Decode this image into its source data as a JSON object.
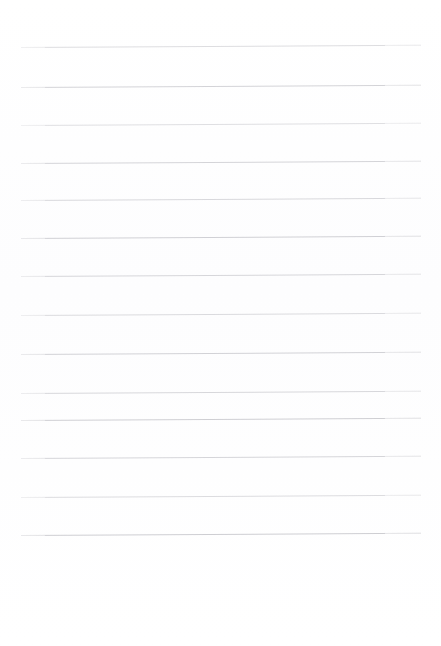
{
  "document": {
    "kind": "scanned-lined-paper",
    "title": "Blank ruled notebook page",
    "written_text": "",
    "page_background_color": "#ffffff",
    "rule_color": "#c9c9ce",
    "page_width": 441,
    "page_height": 646
  },
  "layout": {
    "rule_left_x": 21,
    "rule_right_x": 420,
    "rule_length": 400,
    "rule_thickness": 1,
    "line_spacing": 39,
    "first_line_y": 47,
    "last_line_y": 535,
    "top_margin": 47,
    "bottom_margin": 111,
    "skew_degrees": -0.33,
    "line_count": 14
  },
  "rules": [
    {
      "index": 1,
      "y": 47,
      "label": "ruled-line-1"
    },
    {
      "index": 2,
      "y": 87,
      "label": "ruled-line-2"
    },
    {
      "index": 3,
      "y": 125,
      "label": "ruled-line-3"
    },
    {
      "index": 4,
      "y": 163,
      "label": "ruled-line-4"
    },
    {
      "index": 5,
      "y": 200,
      "label": "ruled-line-5"
    },
    {
      "index": 6,
      "y": 238,
      "label": "ruled-line-6"
    },
    {
      "index": 7,
      "y": 276,
      "label": "ruled-line-7"
    },
    {
      "index": 8,
      "y": 315,
      "label": "ruled-line-8"
    },
    {
      "index": 9,
      "y": 354,
      "label": "ruled-line-9"
    },
    {
      "index": 10,
      "y": 393,
      "label": "ruled-line-10"
    },
    {
      "index": 11,
      "y": 420,
      "label": "ruled-line-11"
    },
    {
      "index": 12,
      "y": 458,
      "label": "ruled-line-12"
    },
    {
      "index": 13,
      "y": 497,
      "label": "ruled-line-13"
    },
    {
      "index": 14,
      "y": 535,
      "label": "ruled-line-14"
    }
  ],
  "write_zones": [
    {
      "index": 1,
      "content": ""
    },
    {
      "index": 2,
      "content": ""
    },
    {
      "index": 3,
      "content": ""
    },
    {
      "index": 4,
      "content": ""
    },
    {
      "index": 5,
      "content": ""
    },
    {
      "index": 6,
      "content": ""
    },
    {
      "index": 7,
      "content": ""
    },
    {
      "index": 8,
      "content": ""
    },
    {
      "index": 9,
      "content": ""
    },
    {
      "index": 10,
      "content": ""
    },
    {
      "index": 11,
      "content": ""
    },
    {
      "index": 12,
      "content": ""
    },
    {
      "index": 13,
      "content": ""
    },
    {
      "index": 14,
      "content": ""
    }
  ]
}
